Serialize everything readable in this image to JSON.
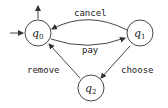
{
  "diagram": {
    "type": "state-machine",
    "states": [
      {
        "id": "q0",
        "label": "q",
        "sub": "0",
        "initial": true
      },
      {
        "id": "q1",
        "label": "q",
        "sub": "1"
      },
      {
        "id": "q2",
        "label": "q",
        "sub": "2"
      }
    ],
    "transitions": [
      {
        "from": "q1",
        "to": "q0",
        "label": "cancel"
      },
      {
        "from": "q0",
        "to": "q1",
        "label": "pay"
      },
      {
        "from": "q1",
        "to": "q2",
        "label": "choose"
      },
      {
        "from": "q2",
        "to": "q0",
        "label": "remove"
      }
    ],
    "colors": {
      "stroke": "#333333",
      "text": "#222222",
      "background": "#ffffff"
    }
  }
}
